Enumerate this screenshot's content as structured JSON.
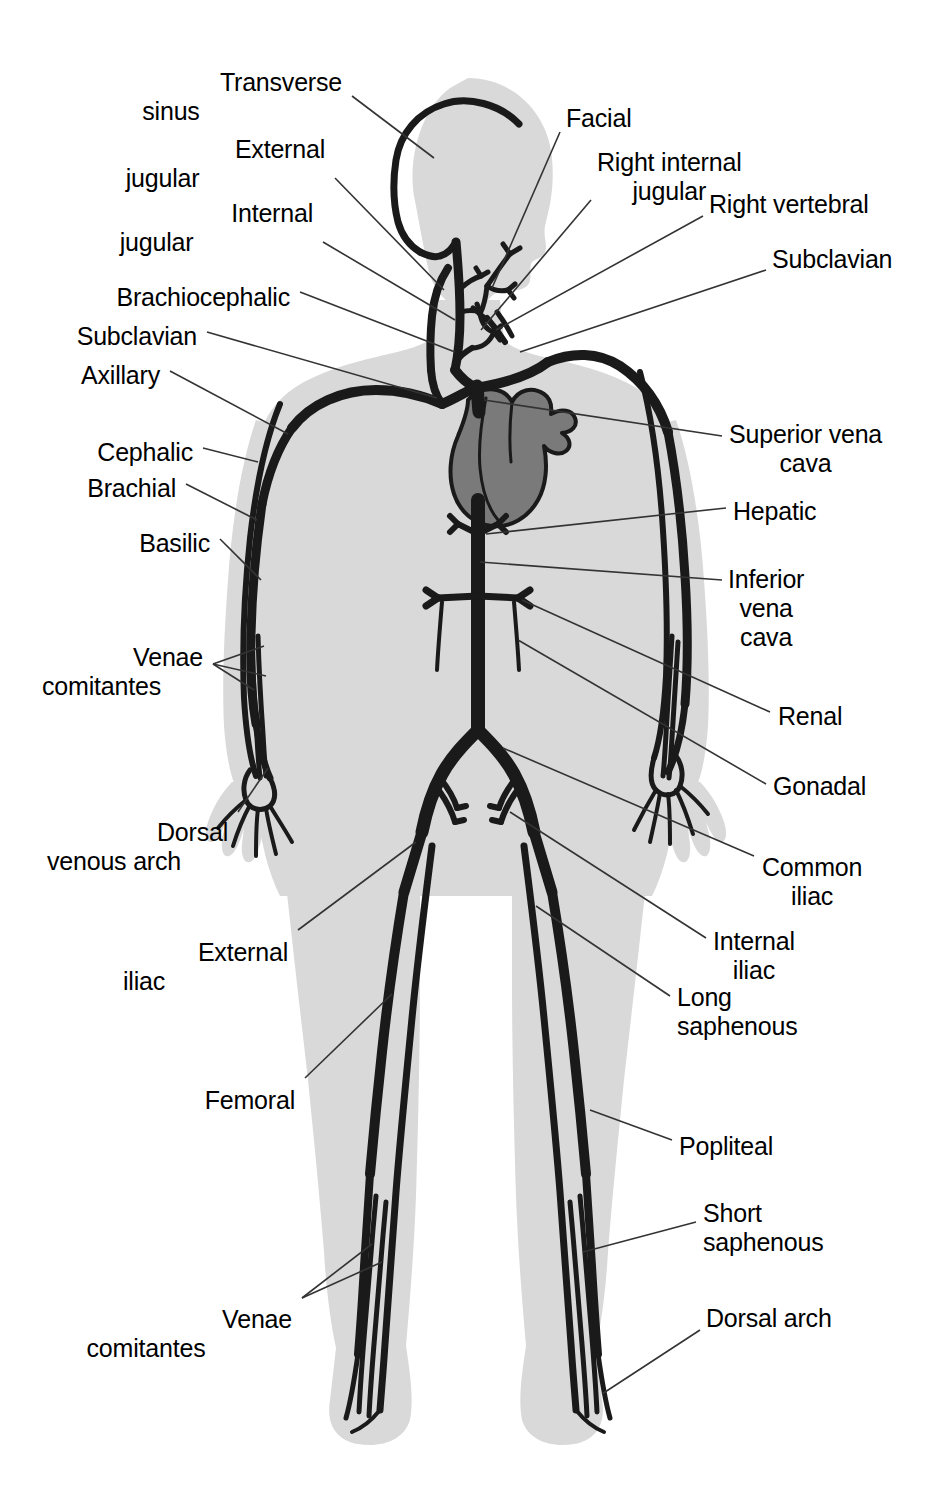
{
  "figure": {
    "kind": "anatomical-diagram",
    "colors": {
      "background": "#ffffff",
      "body_silhouette": "#d9d9d9",
      "vein_stroke": "#1a1a1a",
      "heart_fill": "#7a7a7a",
      "leader_line": "#333333",
      "label_text": "#000000"
    }
  },
  "labels": {
    "left": [
      {
        "id": "transverse-sinus",
        "lines": [
          "Transverse",
          "sinus"
        ],
        "x": 342,
        "y": 68,
        "align": "right"
      },
      {
        "id": "external-jugular",
        "lines": [
          "External",
          "jugular"
        ],
        "x": 325,
        "y": 135,
        "align": "right"
      },
      {
        "id": "internal-jugular",
        "lines": [
          "Internal",
          "jugular"
        ],
        "x": 313,
        "y": 199,
        "align": "right"
      },
      {
        "id": "brachiocephalic",
        "lines": [
          "Brachiocephalic"
        ],
        "x": 290,
        "y": 283,
        "align": "right"
      },
      {
        "id": "subclavian-left",
        "lines": [
          "Subclavian"
        ],
        "x": 197,
        "y": 322,
        "align": "right"
      },
      {
        "id": "axillary",
        "lines": [
          "Axillary"
        ],
        "x": 160,
        "y": 361,
        "align": "right"
      },
      {
        "id": "cephalic",
        "lines": [
          "Cephalic"
        ],
        "x": 193,
        "y": 438,
        "align": "right"
      },
      {
        "id": "brachial",
        "lines": [
          "Brachial"
        ],
        "x": 176,
        "y": 474,
        "align": "right"
      },
      {
        "id": "basilic",
        "lines": [
          "Basilic"
        ],
        "x": 210,
        "y": 529,
        "align": "right"
      },
      {
        "id": "venae-comitantes-arm",
        "lines": [
          "Venae",
          "comitantes"
        ],
        "x": 203,
        "y": 643,
        "align": "right"
      },
      {
        "id": "dorsal-venous-arch",
        "lines": [
          "Dorsal",
          "venous arch"
        ],
        "x": 228,
        "y": 818,
        "align": "right"
      },
      {
        "id": "external-iliac",
        "lines": [
          "External",
          "iliac"
        ],
        "x": 288,
        "y": 938,
        "align": "right"
      },
      {
        "id": "femoral",
        "lines": [
          "Femoral"
        ],
        "x": 295,
        "y": 1086,
        "align": "right"
      },
      {
        "id": "venae-comitantes-leg",
        "lines": [
          "Venae",
          "comitantes"
        ],
        "x": 292,
        "y": 1305,
        "align": "right"
      }
    ],
    "right": [
      {
        "id": "facial",
        "lines": [
          "Facial"
        ],
        "x": 566,
        "y": 104,
        "align": "left"
      },
      {
        "id": "right-internal-jugular",
        "lines": [
          "Right internal",
          "jugular"
        ],
        "x": 597,
        "y": 148,
        "align": "left"
      },
      {
        "id": "right-vertebral",
        "lines": [
          "Right vertebral"
        ],
        "x": 709,
        "y": 190,
        "align": "left"
      },
      {
        "id": "subclavian-right",
        "lines": [
          "Subclavian"
        ],
        "x": 772,
        "y": 245,
        "align": "left"
      },
      {
        "id": "superior-vena-cava",
        "lines": [
          "Superior vena",
          "cava"
        ],
        "x": 729,
        "y": 420,
        "align": "left"
      },
      {
        "id": "hepatic",
        "lines": [
          "Hepatic"
        ],
        "x": 733,
        "y": 497,
        "align": "left"
      },
      {
        "id": "inferior-vena-cava",
        "lines": [
          "Inferior",
          "vena",
          "cava"
        ],
        "x": 728,
        "y": 565,
        "align": "left"
      },
      {
        "id": "renal",
        "lines": [
          "Renal"
        ],
        "x": 778,
        "y": 702,
        "align": "left"
      },
      {
        "id": "gonadal",
        "lines": [
          "Gonadal"
        ],
        "x": 773,
        "y": 772,
        "align": "left"
      },
      {
        "id": "common-iliac",
        "lines": [
          "Common",
          "iliac"
        ],
        "x": 762,
        "y": 853,
        "align": "left"
      },
      {
        "id": "internal-iliac",
        "lines": [
          "Internal",
          "iliac"
        ],
        "x": 713,
        "y": 927,
        "align": "left"
      },
      {
        "id": "long-saphenous",
        "lines": [
          "Long",
          "saphenous"
        ],
        "x": 677,
        "y": 983,
        "align": "left"
      },
      {
        "id": "popliteal",
        "lines": [
          "Popliteal"
        ],
        "x": 679,
        "y": 1132,
        "align": "left"
      },
      {
        "id": "short-saphenous",
        "lines": [
          "Short",
          "saphenous"
        ],
        "x": 703,
        "y": 1199,
        "align": "left"
      },
      {
        "id": "dorsal-arch",
        "lines": [
          "Dorsal arch"
        ],
        "x": 706,
        "y": 1304,
        "align": "left"
      }
    ]
  }
}
